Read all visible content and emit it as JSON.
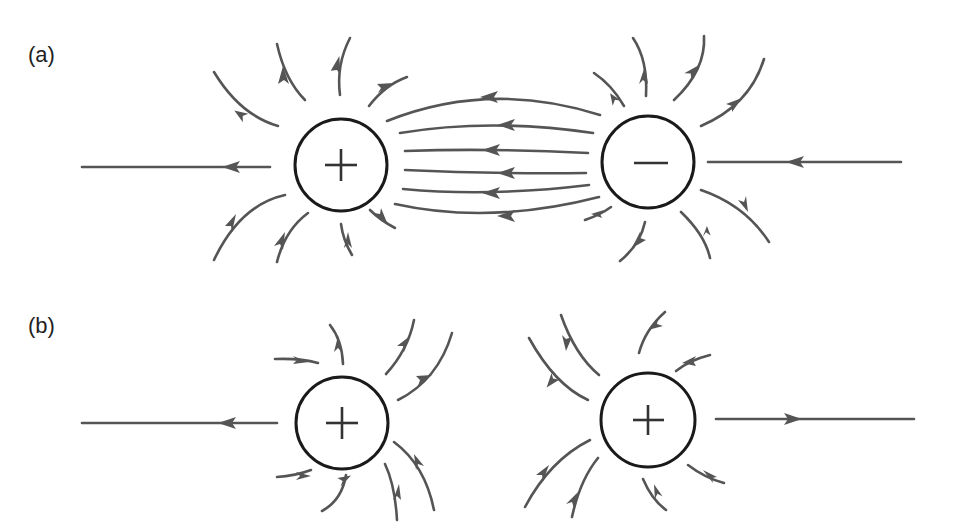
{
  "figure": {
    "panels": [
      {
        "label": "(a)",
        "description": "Electric field lines between a positive and a negative charge",
        "charges": [
          {
            "sign": "+",
            "cx": 341,
            "cy": 165,
            "r": 46
          },
          {
            "sign": "−",
            "cx": 648,
            "cy": 162,
            "r": 46
          }
        ]
      },
      {
        "label": "(b)",
        "description": "Electric field lines between two positive charges",
        "charges": [
          {
            "sign": "+",
            "cx": 342,
            "cy": 423,
            "r": 46
          },
          {
            "sign": "+",
            "cx": 648,
            "cy": 420,
            "r": 47
          }
        ]
      }
    ],
    "colors": {
      "field_line": "#555555",
      "charge_outline": "#1a1a1a",
      "background": "#ffffff"
    }
  }
}
